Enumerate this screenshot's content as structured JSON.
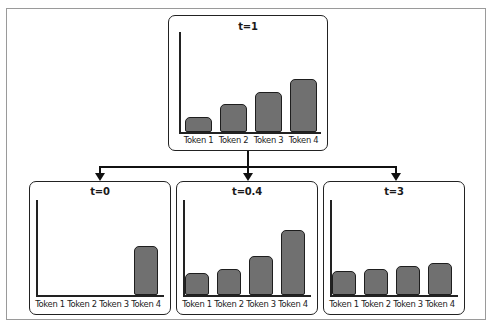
{
  "diagram": {
    "bar_color": "#707070",
    "panels": [
      {
        "id": "top",
        "title": "t=1",
        "labels": [
          "Token 1",
          "Token 2",
          "Token 3",
          "Token 4"
        ],
        "heights": [
          15,
          28,
          40,
          53
        ]
      },
      {
        "id": "left",
        "title": "t=0",
        "labels": [
          "Token 1",
          "Token 2",
          "Token 3",
          "Token 4"
        ],
        "heights": [
          0,
          0,
          0,
          49
        ]
      },
      {
        "id": "middle",
        "title": "t=0.4",
        "labels": [
          "Token 1",
          "Token 2",
          "Token 3",
          "Token 4"
        ],
        "heights": [
          22,
          26,
          39,
          65
        ]
      },
      {
        "id": "right",
        "title": "t=3",
        "labels": [
          "Token 1",
          "Token 2",
          "Token 3",
          "Token 4"
        ],
        "heights": [
          24,
          26,
          29,
          32
        ]
      }
    ]
  },
  "chart_data": [
    {
      "type": "bar",
      "title": "t=1",
      "categories": [
        "Token 1",
        "Token 2",
        "Token 3",
        "Token 4"
      ],
      "values": [
        15,
        28,
        40,
        53
      ],
      "xlabel": "",
      "ylabel": ""
    },
    {
      "type": "bar",
      "title": "t=0",
      "categories": [
        "Token 1",
        "Token 2",
        "Token 3",
        "Token 4"
      ],
      "values": [
        0,
        0,
        0,
        49
      ],
      "xlabel": "",
      "ylabel": ""
    },
    {
      "type": "bar",
      "title": "t=0.4",
      "categories": [
        "Token 1",
        "Token 2",
        "Token 3",
        "Token 4"
      ],
      "values": [
        22,
        26,
        39,
        65
      ],
      "xlabel": "",
      "ylabel": ""
    },
    {
      "type": "bar",
      "title": "t=3",
      "categories": [
        "Token 1",
        "Token 2",
        "Token 3",
        "Token 4"
      ],
      "values": [
        24,
        26,
        29,
        32
      ],
      "xlabel": "",
      "ylabel": ""
    }
  ]
}
